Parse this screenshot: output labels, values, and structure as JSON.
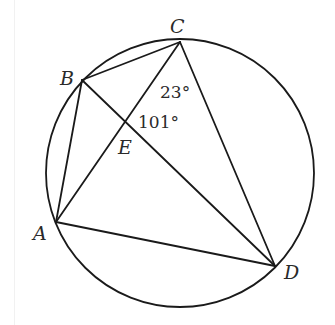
{
  "diagram": {
    "stroke_color": "#1a1a1a",
    "circle": {
      "cx": 180,
      "cy": 173,
      "r": 134
    },
    "points": {
      "A": {
        "label": "A",
        "x": 56,
        "y": 222
      },
      "B": {
        "label": "B",
        "x": 82,
        "y": 80
      },
      "C": {
        "label": "C",
        "x": 180,
        "y": 42
      },
      "D": {
        "label": "D",
        "x": 275,
        "y": 266
      },
      "E": {
        "label": "E",
        "x": 125,
        "y": 121
      }
    },
    "segments": [
      "AB",
      "BC",
      "CD",
      "DA",
      "AC",
      "BD"
    ],
    "angles": {
      "angle_ACD": {
        "label": "23°",
        "at": "C"
      },
      "angle_CED": {
        "label": "101°",
        "at": "E"
      }
    }
  }
}
